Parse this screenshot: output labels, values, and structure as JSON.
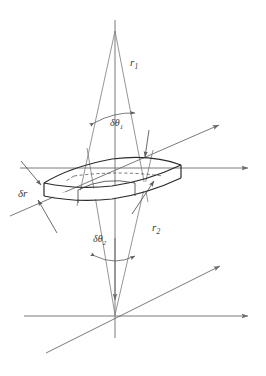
{
  "figure": {
    "background_color": "#ffffff",
    "line_color": "#6b6b6b",
    "solid_edge_color": "#2b2b2b",
    "label_color": "#3a3a3a",
    "width": 266,
    "height": 376
  },
  "labels": {
    "r1": {
      "base": "r",
      "sub": "1"
    },
    "r2": {
      "base": "r",
      "sub": "2"
    },
    "dtheta1": {
      "base": "δθ",
      "sub": "1"
    },
    "dtheta2": {
      "base": "δθ",
      "sub": "2"
    },
    "dr": {
      "base": "δr",
      "sub": ""
    }
  },
  "geometry": {
    "upper_apex": {
      "x": 115,
      "y": 31
    },
    "lower_apex": {
      "x": 115,
      "y": 315
    },
    "upper_axes": {
      "vertical": {
        "x": 115,
        "y_top": 18,
        "y_bottom": 300
      },
      "horizontal": {
        "y": 168,
        "x_left": 20,
        "x_right": 250
      },
      "diagonal": {
        "x1": 10,
        "y1": 216,
        "x2": 221,
        "y2": 124
      }
    },
    "lower_axes": {
      "vertical": {
        "x": 115,
        "y_top": 240,
        "y_bottom": 338
      },
      "horizontal": {
        "y": 316,
        "x_left": 24,
        "x_right": 250
      },
      "diagonal": {
        "x1": 46,
        "y1": 353,
        "x2": 222,
        "y2": 265
      }
    },
    "cone_upper_rays": [
      {
        "x1": 115,
        "y1": 31,
        "x2": 76,
        "y2": 205
      },
      {
        "x1": 115,
        "y1": 31,
        "x2": 147,
        "y2": 200
      }
    ],
    "cone_lower_rays": [
      {
        "x1": 115,
        "y1": 315,
        "x2": 88,
        "y2": 150
      },
      {
        "x1": 115,
        "y1": 315,
        "x2": 152,
        "y2": 152
      }
    ],
    "arc_dtheta1": {
      "cx": 115,
      "cy": 31,
      "r": 92,
      "from_x": 95,
      "from_y": 122,
      "to_x": 134,
      "to_y": 114
    },
    "arc_dtheta2": {
      "cx": 115,
      "cy": 315,
      "r": 60,
      "from_x": 96,
      "from_y": 259,
      "to_x": 134,
      "to_y": 259
    },
    "volume_element": {
      "top_face": [
        {
          "x": 48,
          "y": 185
        },
        {
          "x": 96,
          "y": 167
        },
        {
          "x": 140,
          "y": 158
        },
        {
          "x": 185,
          "y": 165
        },
        {
          "x": 142,
          "y": 181
        },
        {
          "x": 92,
          "y": 190
        }
      ],
      "thickness_px": 14
    },
    "pointer_arrows": [
      {
        "name": "dr-upper",
        "x1": 22,
        "y1": 163,
        "x2": 42,
        "y2": 186
      },
      {
        "name": "dr-lower",
        "x1": 55,
        "y1": 230,
        "x2": 37,
        "y2": 199
      },
      {
        "name": "r1-tip",
        "x1": 148,
        "y1": 131,
        "x2": 145,
        "y2": 158
      },
      {
        "name": "r2-tip",
        "x1": 133,
        "y1": 212,
        "x2": 154,
        "y2": 180
      }
    ]
  }
}
